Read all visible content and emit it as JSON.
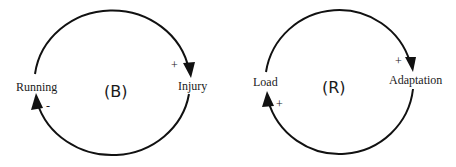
{
  "diagrams": [
    {
      "loop_type": "(B)",
      "nodes": [
        {
          "label": "Running"
        },
        {
          "label": "Injury"
        }
      ],
      "links": [
        {
          "from": "Running",
          "to": "Injury",
          "polarity": "+"
        },
        {
          "from": "Injury",
          "to": "Running",
          "polarity": "-"
        }
      ]
    },
    {
      "loop_type": "(R)",
      "nodes": [
        {
          "label": "Load"
        },
        {
          "label": "Adaptation"
        }
      ],
      "links": [
        {
          "from": "Load",
          "to": "Adaptation",
          "polarity": "+"
        },
        {
          "from": "Adaptation",
          "to": "Load",
          "polarity": "+"
        }
      ]
    }
  ],
  "colors": {
    "stroke": "#111111",
    "text": "#1a1a1a",
    "background": "#ffffff"
  }
}
